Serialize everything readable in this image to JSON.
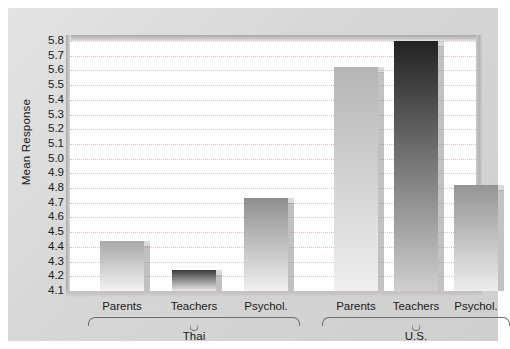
{
  "chart_data": {
    "type": "bar",
    "title": "",
    "xlabel": "",
    "ylabel": "Mean Response",
    "ylim": [
      4.1,
      5.8
    ],
    "ytick_step": 0.1,
    "grid": true,
    "legend": "none",
    "categories": [
      "Parents",
      "Teachers",
      "Psychol."
    ],
    "groups": [
      {
        "name": "Thai",
        "bars": [
          {
            "category": "Parents",
            "value": 4.44
          },
          {
            "category": "Teachers",
            "value": 4.24
          },
          {
            "category": "Psychol.",
            "value": 4.73
          }
        ]
      },
      {
        "name": "U.S.",
        "bars": [
          {
            "category": "Parents",
            "value": 5.62
          },
          {
            "category": "Teachers",
            "value": 5.8
          },
          {
            "category": "Psychol.",
            "value": 4.82
          }
        ]
      }
    ],
    "yticks": [
      "5.8",
      "5.7",
      "5.6",
      "5.5",
      "5.4",
      "5.3",
      "5.2",
      "5.1",
      "5.0",
      "4.9",
      "4.8",
      "4.7",
      "4.6",
      "4.5",
      "4.4",
      "4.3",
      "4.2",
      "4.1"
    ],
    "bar_styles": [
      {
        "group": "Thai",
        "category": "Parents",
        "top": "#a8a8a8",
        "bottom": "#f2f2f2"
      },
      {
        "group": "Thai",
        "category": "Teachers",
        "top": "#3a3a3a",
        "bottom": "#e8e8e8"
      },
      {
        "group": "Thai",
        "category": "Psychol.",
        "top": "#8f8f8f",
        "bottom": "#f0f0f0"
      },
      {
        "group": "U.S.",
        "category": "Parents",
        "top": "#b5b5b5",
        "bottom": "#efefef"
      },
      {
        "group": "U.S.",
        "category": "Teachers",
        "top": "#222222",
        "bottom": "#cfcfcf"
      },
      {
        "group": "U.S.",
        "category": "Psychol.",
        "top": "#949494",
        "bottom": "#ededed"
      }
    ],
    "colors": {
      "figure_background": "#ffffff",
      "card_background": "#d9d9d9",
      "plot_background": "#ffffff",
      "gridline": "#e3bdbd",
      "text": "#1a1a1a",
      "brace": "#6e6e6e"
    }
  }
}
